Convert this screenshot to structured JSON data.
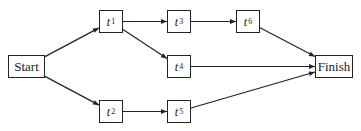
{
  "diagram": {
    "type": "activity-network",
    "nodes": [
      {
        "id": "start",
        "label": "Start",
        "var": "",
        "sub": "",
        "x": 8,
        "y": 55,
        "w": 37,
        "h": 23
      },
      {
        "id": "t1",
        "label": "",
        "var": "t",
        "sub": "1",
        "x": 99,
        "y": 10,
        "w": 24,
        "h": 23
      },
      {
        "id": "t2",
        "label": "",
        "var": "t",
        "sub": "2",
        "x": 99,
        "y": 100,
        "w": 24,
        "h": 23
      },
      {
        "id": "t3",
        "label": "",
        "var": "t",
        "sub": "3",
        "x": 167,
        "y": 10,
        "w": 24,
        "h": 23
      },
      {
        "id": "t4",
        "label": "",
        "var": "t",
        "sub": "4",
        "x": 167,
        "y": 55,
        "w": 24,
        "h": 23
      },
      {
        "id": "t5",
        "label": "",
        "var": "t",
        "sub": "5",
        "x": 167,
        "y": 100,
        "w": 24,
        "h": 23
      },
      {
        "id": "t6",
        "label": "",
        "var": "t",
        "sub": "6",
        "x": 236,
        "y": 10,
        "w": 24,
        "h": 23
      },
      {
        "id": "finish",
        "label": "Finish",
        "var": "",
        "sub": "",
        "x": 315,
        "y": 55,
        "w": 38,
        "h": 23
      }
    ],
    "edges": [
      {
        "from": "start",
        "to": "t1"
      },
      {
        "from": "start",
        "to": "t2"
      },
      {
        "from": "t1",
        "to": "t3"
      },
      {
        "from": "t1",
        "to": "t4"
      },
      {
        "from": "t3",
        "to": "t6"
      },
      {
        "from": "t2",
        "to": "t5"
      },
      {
        "from": "t6",
        "to": "finish"
      },
      {
        "from": "t4",
        "to": "finish"
      },
      {
        "from": "t5",
        "to": "finish"
      }
    ],
    "colors": {
      "stroke": "#222222",
      "background": "#ffffff"
    }
  },
  "labels": {
    "start": "Start",
    "finish": "Finish",
    "t1": {
      "var": "t",
      "sub": "1"
    },
    "t2": {
      "var": "t",
      "sub": "2"
    },
    "t3": {
      "var": "t",
      "sub": "3"
    },
    "t4": {
      "var": "t",
      "sub": "4"
    },
    "t5": {
      "var": "t",
      "sub": "5"
    },
    "t6": {
      "var": "t",
      "sub": "6"
    }
  }
}
